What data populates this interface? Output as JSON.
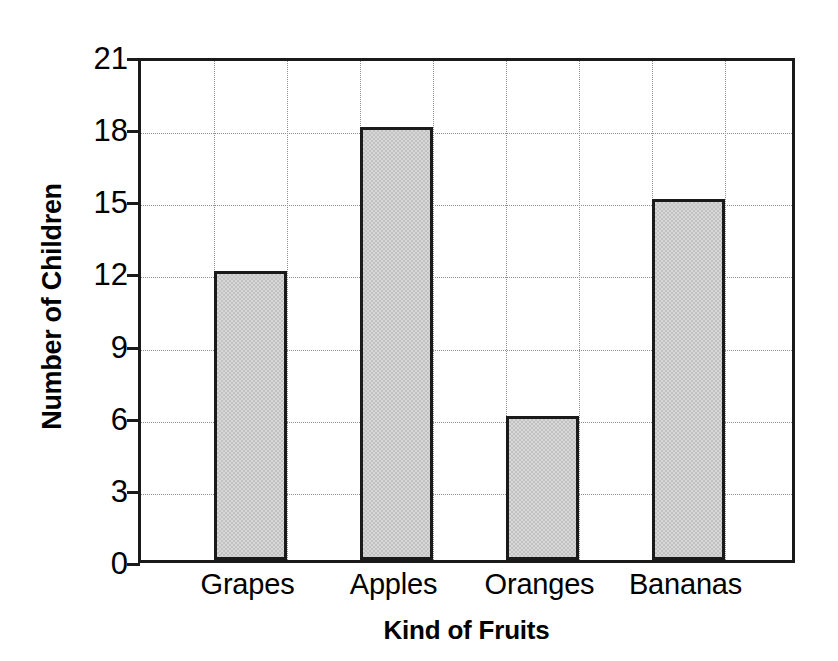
{
  "chart_data": {
    "type": "bar",
    "title": "",
    "xlabel": "Kind of Fruits",
    "ylabel": "Number of Children",
    "categories": [
      "Grapes",
      "Apples",
      "Oranges",
      "Bananas"
    ],
    "values": [
      12,
      18,
      6,
      15
    ],
    "ylim": [
      0,
      21
    ],
    "ytick_labels": [
      "0",
      "3",
      "6",
      "9",
      "12",
      "15",
      "18",
      "21"
    ],
    "ytick_values": [
      0,
      3,
      6,
      9,
      12,
      15,
      18,
      21
    ],
    "grid": true,
    "legend": "none",
    "bar_fill_color": "#d7d7d7",
    "bar_edge_color": "#1a1a1a",
    "grid_color": "#8d8d8d",
    "axis_color": "#1a1a1a",
    "background_color": "#ffffff",
    "n_vertical_gridlines": 8
  }
}
